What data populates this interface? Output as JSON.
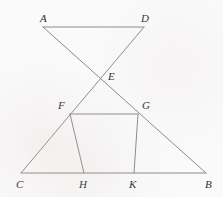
{
  "figure": {
    "type": "geometry-diagram",
    "background_color": "#fbfafa",
    "line_color": "#8b8a88",
    "label_color": "#2e2e2e",
    "points": {
      "A": {
        "x": 43,
        "y": 27,
        "label": "A",
        "label_x": 40,
        "label_y": 13
      },
      "D": {
        "x": 144,
        "y": 27,
        "label": "D",
        "label_x": 141,
        "label_y": 13
      },
      "E": {
        "x": 100,
        "y": 77,
        "label": "E",
        "label_x": 108,
        "label_y": 71
      },
      "F": {
        "x": 70,
        "y": 114,
        "label": "F",
        "label_x": 58,
        "label_y": 100
      },
      "G": {
        "x": 138,
        "y": 114,
        "label": "G",
        "label_x": 142,
        "label_y": 100
      },
      "C": {
        "x": 21,
        "y": 173,
        "label": "C",
        "label_x": 16,
        "label_y": 179
      },
      "H": {
        "x": 84,
        "y": 173,
        "label": "H",
        "label_x": 79,
        "label_y": 179
      },
      "K": {
        "x": 134,
        "y": 173,
        "label": "K",
        "label_x": 129,
        "label_y": 179
      },
      "B": {
        "x": 206,
        "y": 173,
        "label": "B",
        "label_x": 205,
        "label_y": 179
      }
    },
    "segments": [
      {
        "name": "segment-AD",
        "from": "A",
        "to": "D"
      },
      {
        "name": "segment-AB",
        "from": "A",
        "to": "B"
      },
      {
        "name": "segment-DC",
        "from": "D",
        "to": "C"
      },
      {
        "name": "segment-CB",
        "from": "C",
        "to": "B"
      },
      {
        "name": "segment-FG",
        "from": "F",
        "to": "G"
      },
      {
        "name": "segment-FH",
        "from": "F",
        "to": "H"
      },
      {
        "name": "segment-GK",
        "from": "G",
        "to": "K"
      }
    ]
  }
}
